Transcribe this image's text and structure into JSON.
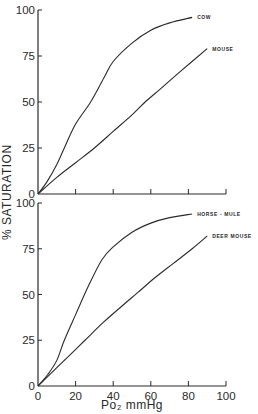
{
  "chart_data": [
    {
      "type": "line",
      "title": "",
      "xlabel": "Po2 mmHg",
      "ylabel": "% SATURATION",
      "xlim": [
        0,
        100
      ],
      "ylim": [
        0,
        100
      ],
      "x_ticks": [
        0,
        20,
        40,
        60,
        80,
        100
      ],
      "y_ticks": [
        0,
        25,
        50,
        75,
        100
      ],
      "grid": false,
      "legend_position": "inline labels at curve ends",
      "series": [
        {
          "name": "COW",
          "x": [
            0,
            5,
            10,
            14,
            20,
            28,
            35,
            40,
            50,
            60,
            70,
            82
          ],
          "y": [
            0,
            7,
            16,
            25,
            38,
            50,
            63,
            72,
            82,
            89,
            93,
            96
          ]
        },
        {
          "name": "MOUSE",
          "x": [
            0,
            10,
            20,
            30,
            40,
            50,
            57,
            65,
            75,
            90
          ],
          "y": [
            0,
            9,
            17,
            25,
            34,
            43,
            50,
            57,
            66,
            79
          ]
        }
      ]
    },
    {
      "type": "line",
      "title": "",
      "xlabel": "Po2 mmHg",
      "ylabel": "% SATURATION",
      "xlim": [
        0,
        100
      ],
      "ylim": [
        0,
        100
      ],
      "x_ticks": [
        0,
        20,
        40,
        60,
        80,
        100
      ],
      "y_ticks": [
        0,
        25,
        50,
        75,
        100
      ],
      "grid": false,
      "legend_position": "inline labels at curve ends",
      "series": [
        {
          "name": "HORSE - MULE",
          "x": [
            0,
            5,
            10,
            14,
            20,
            27,
            34,
            40,
            50,
            60,
            70,
            82
          ],
          "y": [
            0,
            6,
            14,
            25,
            39,
            55,
            69,
            76,
            84,
            89,
            92,
            94
          ]
        },
        {
          "name": "DEER MOUSE",
          "x": [
            0,
            10,
            18,
            25,
            35,
            45,
            53,
            62,
            72,
            82,
            90
          ],
          "y": [
            0,
            10,
            18,
            25,
            35,
            44,
            51,
            59,
            67,
            75,
            82
          ]
        }
      ]
    }
  ],
  "labels": {
    "y_axis_title": "% SATURATION",
    "x_axis_title": "Po₂ mmHg",
    "top_series": [
      "COW",
      "MOUSE"
    ],
    "bottom_series": [
      "HORSE - MULE",
      "DEER MOUSE"
    ],
    "y_ticks": [
      "0",
      "25",
      "50",
      "75",
      "100"
    ],
    "x_ticks": [
      "0",
      "20",
      "40",
      "60",
      "80",
      "100"
    ]
  },
  "colors": {
    "ink": "#2a2a2a",
    "background": "#ffffff"
  }
}
